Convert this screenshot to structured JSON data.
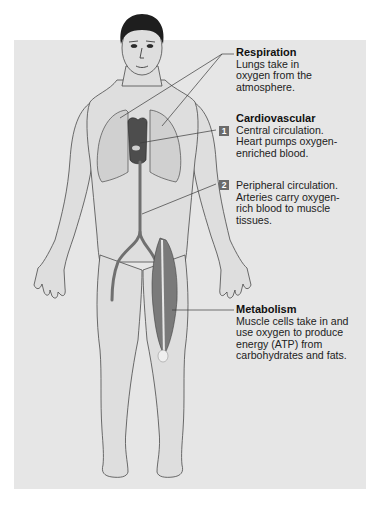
{
  "figure": {
    "colors": {
      "panel_background": "#e6e6e6",
      "skin": "#dedede",
      "outline": "#4a4a4a",
      "hair": "#1e1e1e",
      "artery": "#707070",
      "muscle": "#7a7a7a",
      "heart": "#4d4d4d",
      "badge": "#6b6b6b",
      "leader_line": "#3a3a3a"
    }
  },
  "labels": {
    "respiration": {
      "title": "Respiration",
      "lines": [
        "Lungs take in",
        "oxygen from the",
        "atmosphere."
      ]
    },
    "cardiovascular": {
      "title": "Cardiovascular",
      "central": {
        "badge": "1",
        "lines": [
          "Central circulation.",
          "Heart pumps oxygen-",
          "enriched blood."
        ]
      },
      "peripheral": {
        "badge": "2",
        "lines": [
          "Peripheral circulation.",
          "Arteries carry oxygen-",
          "rich blood to muscle",
          "tissues."
        ]
      }
    },
    "metabolism": {
      "title": "Metabolism",
      "lines": [
        "Muscle cells take in and",
        "use oxygen to produce",
        "energy (ATP) from",
        "carbohydrates and fats."
      ]
    }
  }
}
